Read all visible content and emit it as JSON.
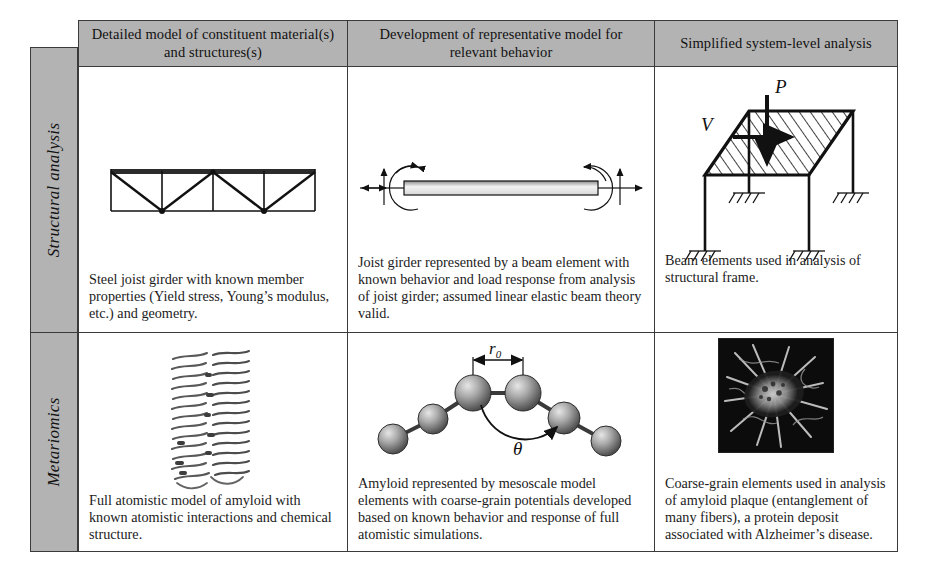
{
  "table": {
    "column_headers": [
      "Detailed model of constituent material(s) and structures(s)",
      "Development of representative model for relevant behavior",
      "Simplified system-level analysis"
    ],
    "row_labels": [
      "Structural analysis",
      "Metariomics"
    ],
    "rows": [
      {
        "label": "Structural analysis",
        "cells": [
          {
            "figure": "steel-joist-girder-truss",
            "caption": "Steel joist girder with known member properties (Yield stress, Young’s modulus, etc.) and geometry."
          },
          {
            "figure": "beam-element-with-end-forces-and-moments",
            "caption": "Joist girder represented by a beam element with known behavior and load response from analysis of joist girder; assumed linear elastic beam theory valid."
          },
          {
            "figure": "structural-frame-with-loads",
            "caption": "Beam elements used in analysis of structural frame."
          }
        ]
      },
      {
        "label": "Metariomics",
        "cells": [
          {
            "figure": "atomistic-amyloid-fibril",
            "caption": "Full atomistic model of amyloid with known atomistic interactions and chemical structure."
          },
          {
            "figure": "coarse-grain-bead-spring-model",
            "caption": "Amyloid represented by mesoscale model elements with coarse-grain potentials developed based on known behavior and response of full atomistic simulations."
          },
          {
            "figure": "amyloid-plaque-micrograph",
            "caption": "Coarse-grain elements used in analysis of amyloid plaque (entanglement of many fibers), a protein deposit associated with Alzheimer’s disease."
          }
        ]
      }
    ]
  },
  "figure_labels": {
    "frame_vertical_load": "P",
    "frame_lateral_load": "V",
    "bead_bond_length": "r",
    "bead_bond_length_sub": "0",
    "bead_angle": "θ"
  },
  "colors": {
    "header_fill": "#b3b3b3",
    "row_label_fill": "#b3b3b3",
    "border": "#3a3a3a",
    "text": "#1a1a1a",
    "page_background": "#ffffff"
  }
}
